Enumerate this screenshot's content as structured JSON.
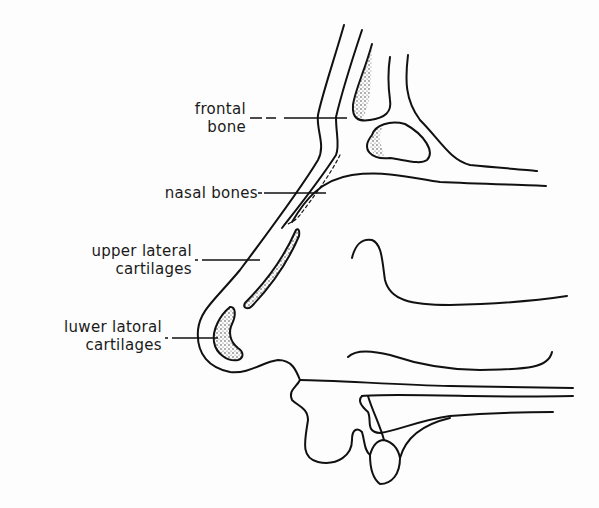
{
  "diagram": {
    "type": "anatomical-line-drawing",
    "stroke_color": "#111111",
    "background": "#fdfdfd"
  },
  "labels": [
    {
      "id": "frontal-bone",
      "line1": "frontal",
      "line2": "bone"
    },
    {
      "id": "nasal-bones",
      "line1": "nasal bones",
      "line2": ""
    },
    {
      "id": "upper-lateral-cartilages",
      "line1": "upper lateral",
      "line2": "cartilages"
    },
    {
      "id": "lower-lateral-cartilages",
      "line1": "luwer latoral",
      "line2": "cartilages"
    }
  ]
}
